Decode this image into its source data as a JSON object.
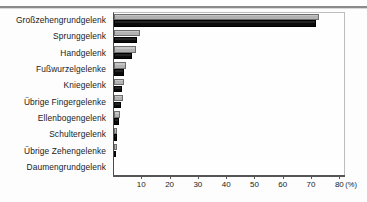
{
  "figure": {
    "background_color": "#fdfdfd",
    "rule_color": "#8a8a8a"
  },
  "axis": {
    "unit_label": "(%)",
    "tick_labels": [
      "10",
      "20",
      "30",
      "40",
      "50",
      "60",
      "70",
      "80"
    ],
    "tick_values": [
      10,
      20,
      30,
      40,
      50,
      60,
      70,
      80
    ]
  },
  "series_colors": {
    "series_light": "#b9b9b9",
    "series_dark": "#141414"
  },
  "chart_data": {
    "type": "bar",
    "orientation": "horizontal",
    "title": "",
    "subtitle": "",
    "xlabel": "(%)",
    "ylabel": "",
    "xlim": [
      0,
      82
    ],
    "grid": false,
    "legend": "none",
    "categories": [
      "Großzehengrundgelenk",
      "Sprunggelenk",
      "Handgelenk",
      "Fußwurzelgelenke",
      "Kniegelenk",
      "Übrige Fingergelenke",
      "Ellenbogengelenk",
      "Schultergelenk",
      "Übrige Zehengelenke",
      "Daumengrundgelenk"
    ],
    "series": [
      {
        "name": "series_light",
        "color": "#b9b9b9",
        "values": [
          72.5,
          9.2,
          7.6,
          4.4,
          3.5,
          3.1,
          2.0,
          1.2,
          1.0,
          0.0
        ]
      },
      {
        "name": "series_dark",
        "color": "#141414",
        "values": [
          71.5,
          8.0,
          6.4,
          3.6,
          2.8,
          2.4,
          1.6,
          1.0,
          0.8,
          0.0
        ]
      }
    ]
  }
}
